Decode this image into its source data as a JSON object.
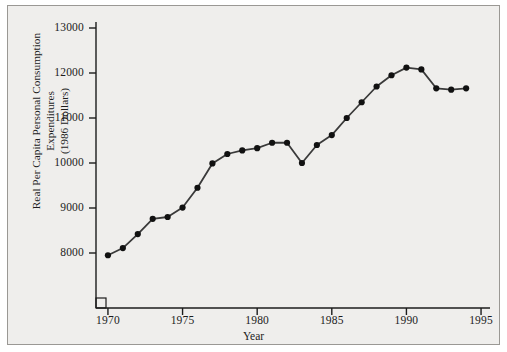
{
  "chart_data": {
    "type": "line",
    "title": "",
    "xlabel": "Year",
    "ylabel": "Real Per Capita Personal Consumption Expenditures (1986 Dollars)",
    "ylabel_line1": "Real Per Capita Personal Consumption Expenditures",
    "ylabel_line2": "(1986 Dollars)",
    "grid": false,
    "legend": "none",
    "marker": "filled-circle",
    "line_color": "#3a3a3a",
    "marker_color": "#111111",
    "background_color": "#efeeec",
    "xlim": [
      1969.2,
      1995.6
    ],
    "ylim": [
      7450,
      13350
    ],
    "xticks": [
      1970,
      1975,
      1980,
      1985,
      1990,
      1995
    ],
    "xtick_labels": [
      "1970",
      "1975",
      "1980",
      "1985",
      "1990",
      "1995"
    ],
    "yticks": [
      8000,
      9000,
      10000,
      11000,
      12000,
      13000
    ],
    "ytick_labels": [
      "8000",
      "9000",
      "10000",
      "11000",
      "12000",
      "13000"
    ],
    "x": [
      1970,
      1971,
      1972,
      1973,
      1974,
      1975,
      1976,
      1977,
      1978,
      1979,
      1980,
      1981,
      1982,
      1983,
      1984,
      1985,
      1986,
      1987,
      1988,
      1989,
      1990,
      1991,
      1992,
      1993,
      1994
    ],
    "values": [
      7950,
      8110,
      8420,
      8760,
      8800,
      9010,
      9450,
      9990,
      10200,
      10280,
      10330,
      10450,
      10450,
      10000,
      10400,
      10620,
      11000,
      11350,
      11700,
      11950,
      12120,
      12080,
      11660,
      11630,
      11660
    ],
    "series": [
      {
        "name": "Real Per Capita Personal Consumption Expenditures",
        "values": [
          7950,
          8110,
          8420,
          8760,
          8800,
          9010,
          9450,
          9990,
          10200,
          10280,
          10330,
          10450,
          10450,
          10000,
          10400,
          10620,
          11000,
          11350,
          11700,
          11950,
          12120,
          12080,
          11660,
          11630,
          11660
        ]
      }
    ]
  }
}
